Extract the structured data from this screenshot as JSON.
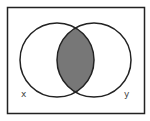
{
  "diagram": {
    "type": "venn",
    "universe": {
      "shape": "rectangle"
    },
    "sets": [
      {
        "id": "x",
        "label": "x"
      },
      {
        "id": "y",
        "label": "y"
      }
    ],
    "shaded_region": "x ∩ y",
    "colors": {
      "outline": "#222222",
      "shade": "#777777",
      "background": "#ffffff"
    }
  }
}
